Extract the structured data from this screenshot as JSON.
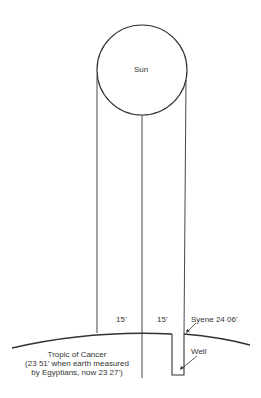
{
  "diagram": {
    "sun_label": "Sun",
    "angle_left": "15'",
    "angle_right": "15'",
    "syene_label": "Syene 24 06'",
    "well_label": "Well",
    "tropic_lines": [
      "Tropic of Cancer",
      "(23 51' when earth measured",
      "by Egyptians, now 23 27')"
    ],
    "line_color": "#333333"
  }
}
